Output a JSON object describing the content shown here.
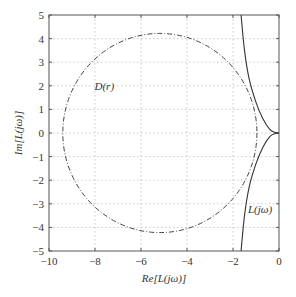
{
  "chart_data": {
    "type": "line",
    "title": "",
    "xlabel": "Re[L(jω)]",
    "ylabel": "Im[L(jω)]",
    "xlim": [
      -10,
      0
    ],
    "ylim": [
      -5,
      5
    ],
    "xticks": [
      -10,
      -8,
      -6,
      -4,
      -2,
      0
    ],
    "yticks": [
      -5,
      -4,
      -3,
      -2,
      -1,
      0,
      1,
      2,
      3,
      4,
      5
    ],
    "xtick_labels": [
      "−10",
      "−8",
      "−6",
      "−4",
      "−2",
      "0"
    ],
    "ytick_labels": [
      "−5",
      "−4",
      "−3",
      "−2",
      "−1",
      "0",
      "1",
      "2",
      "3",
      "4",
      "5"
    ],
    "grid": true,
    "series": [
      {
        "name": "D(r)",
        "style": "dash-dot",
        "shape": "circle",
        "center": [
          -5.18,
          0
        ],
        "radius": 4.22
      },
      {
        "name": "L(jω)",
        "style": "solid",
        "upper_branch": [
          [
            -1.65,
            5
          ],
          [
            -1.5,
            3.5
          ],
          [
            -1.3,
            2.3
          ],
          [
            -1.0,
            1.3
          ],
          [
            -0.7,
            0.6
          ],
          [
            -0.4,
            0.15
          ],
          [
            -0.15,
            0.02
          ],
          [
            0,
            0
          ]
        ],
        "lower_branch": [
          [
            -1.65,
            -5
          ],
          [
            -1.5,
            -3.5
          ],
          [
            -1.3,
            -2.3
          ],
          [
            -1.0,
            -1.3
          ],
          [
            -0.7,
            -0.6
          ],
          [
            -0.4,
            -0.15
          ],
          [
            -0.15,
            -0.02
          ],
          [
            0,
            0
          ]
        ]
      }
    ],
    "annotations": [
      {
        "text": "D(r)",
        "x": -7.5,
        "y": 2
      },
      {
        "text": "L(jω)",
        "x": -1.0,
        "y": -3.2
      }
    ]
  },
  "labels": {
    "xlabel": "Re[L(jω)]",
    "ylabel": "Im[L(jω)]",
    "annot_d": "D(r)",
    "annot_l": "L(jω)"
  }
}
